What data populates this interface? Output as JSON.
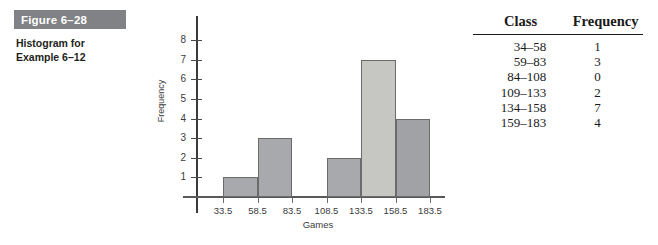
{
  "figure": {
    "number_label": "Figure 6–28",
    "caption_line1": "Histogram for",
    "caption_line2": "Example 6–12"
  },
  "table": {
    "headers": {
      "class": "Class",
      "frequency": "Frequency"
    },
    "rows": [
      {
        "class": "34–58",
        "frequency": "1"
      },
      {
        "class": "59–83",
        "frequency": "3"
      },
      {
        "class": "84–108",
        "frequency": "0"
      },
      {
        "class": "109–133",
        "frequency": "2"
      },
      {
        "class": "134–158",
        "frequency": "7"
      },
      {
        "class": "159–183",
        "frequency": "4"
      }
    ]
  },
  "chart_data": {
    "type": "bar",
    "title": "",
    "xlabel": "Games",
    "ylabel": "Frequency",
    "categories": [
      "34–58",
      "59–83",
      "84–108",
      "109–133",
      "134–158",
      "159–183"
    ],
    "values": [
      1,
      3,
      0,
      2,
      7,
      4
    ],
    "boundaries": [
      33.5,
      58.5,
      83.5,
      108.5,
      133.5,
      158.5,
      183.5
    ],
    "boundary_labels": [
      "33.5",
      "58.5",
      "83.5",
      "108.5",
      "133.5",
      "158.5",
      "183.5"
    ],
    "ytick_labels": [
      "1",
      "2",
      "3",
      "4",
      "5",
      "6",
      "7",
      "8"
    ],
    "ytick_values": [
      1,
      2,
      3,
      4,
      5,
      6,
      7,
      8
    ],
    "ylim": [
      0,
      8.6
    ],
    "xlim": [
      33.5,
      183.5
    ],
    "grid": false,
    "legend": false,
    "bar_colors": [
      "#a7a9ac",
      "#a7a9ac",
      "#a7a9ac",
      "#a7a9ac",
      "#c6c7c3",
      "#a0a2a5"
    ],
    "accent_color": "#808285"
  }
}
